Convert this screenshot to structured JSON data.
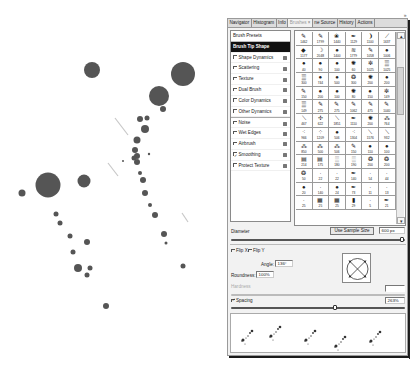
{
  "artwork": {
    "description": "ink splatter",
    "ink_color": "#555555"
  },
  "panel": {
    "tabs": [
      {
        "label": "Navigator",
        "active": false
      },
      {
        "label": "Histogram",
        "active": false
      },
      {
        "label": "Info",
        "active": false
      },
      {
        "label": "Brushes",
        "active": true,
        "close": "×"
      },
      {
        "label": "ne Source",
        "active": false
      },
      {
        "label": "History",
        "active": false
      },
      {
        "label": "Actions",
        "active": false
      }
    ],
    "menu_icon": "»",
    "settings": [
      {
        "label": "Brush Presets",
        "type": "header"
      },
      {
        "label": "Brush Tip Shape",
        "type": "selected"
      },
      {
        "label": "Shape Dynamics",
        "checked": false,
        "lock": true
      },
      {
        "label": "Scattering",
        "checked": false,
        "lock": true
      },
      {
        "label": "Texture",
        "checked": false,
        "lock": true
      },
      {
        "label": "Dual Brush",
        "checked": false,
        "lock": true
      },
      {
        "label": "Color Dynamics",
        "checked": false,
        "lock": true
      },
      {
        "label": "Other Dynamics",
        "checked": false,
        "lock": true
      },
      {
        "label": "Noise",
        "checked": false,
        "lock": true
      },
      {
        "label": "Wet Edges",
        "checked": false,
        "lock": true
      },
      {
        "label": "Airbrush",
        "checked": false,
        "lock": true
      },
      {
        "label": "Smoothing",
        "checked": true,
        "lock": true
      },
      {
        "label": "Protect Texture",
        "checked": false,
        "lock": true
      }
    ],
    "brushes": [
      {
        "n": "1462",
        "g": "✎"
      },
      {
        "n": "1799",
        "g": "✎"
      },
      {
        "n": "1440",
        "g": "❀"
      },
      {
        "n": "1129",
        "g": "✒"
      },
      {
        "n": "1100",
        "g": "❩"
      },
      {
        "n": "1637",
        "g": "⟋"
      },
      {
        "n": "1177",
        "g": "◆"
      },
      {
        "n": "2048",
        "g": "☽"
      },
      {
        "n": "1400",
        "g": "●"
      },
      {
        "n": "1779",
        "g": "≋"
      },
      {
        "n": "1058",
        "g": "✎"
      },
      {
        "n": "1006",
        "g": "●"
      },
      {
        "n": "40",
        "g": "●"
      },
      {
        "n": "90",
        "g": "●"
      },
      {
        "n": "100",
        "g": "●"
      },
      {
        "n": "60",
        "g": "✺"
      },
      {
        "n": "1025",
        "g": "✼"
      },
      {
        "n": "1025",
        "g": "▒"
      },
      {
        "n": "300",
        "g": "▒"
      },
      {
        "n": "744",
        "g": "●"
      },
      {
        "n": "500",
        "g": "●"
      },
      {
        "n": "300",
        "g": "❂"
      },
      {
        "n": "200",
        "g": "✺"
      },
      {
        "n": "200",
        "g": "●"
      },
      {
        "n": "150",
        "g": "✎"
      },
      {
        "n": "200",
        "g": "●"
      },
      {
        "n": "100",
        "g": "●"
      },
      {
        "n": "80",
        "g": "✺"
      },
      {
        "n": "150",
        "g": "●"
      },
      {
        "n": "149",
        "g": "✼"
      },
      {
        "n": "149",
        "g": "▒"
      },
      {
        "n": "275",
        "g": "✎"
      },
      {
        "n": "275",
        "g": "✎"
      },
      {
        "n": "1062",
        "g": "✎"
      },
      {
        "n": "475",
        "g": "✎"
      },
      {
        "n": "1040",
        "g": "✎"
      },
      {
        "n": "467",
        "g": "⟍"
      },
      {
        "n": "622",
        "g": "✢"
      },
      {
        "n": "1851",
        "g": "⟍"
      },
      {
        "n": "1110",
        "g": "✒"
      },
      {
        "n": "200",
        "g": "✺"
      },
      {
        "n": "764",
        "g": "⁂"
      },
      {
        "n": "966",
        "g": "⁖"
      },
      {
        "n": "1209",
        "g": "⁘"
      },
      {
        "n": "506",
        "g": "●"
      },
      {
        "n": "1304",
        "g": "⁖"
      },
      {
        "n": "1576",
        "g": "⟍"
      },
      {
        "n": "932",
        "g": "⟍"
      },
      {
        "n": "850",
        "g": "⁂"
      },
      {
        "n": "500",
        "g": "⁂"
      },
      {
        "n": "506",
        "g": "⁂"
      },
      {
        "n": "150",
        "g": "✎"
      },
      {
        "n": "110",
        "g": "●"
      },
      {
        "n": "100",
        "g": "●"
      },
      {
        "n": "214",
        "g": "▤"
      },
      {
        "n": "175",
        "g": "▤"
      },
      {
        "n": "180",
        "g": "░"
      },
      {
        "n": "190",
        "g": "░"
      },
      {
        "n": "200",
        "g": "❂"
      },
      {
        "n": "200",
        "g": "❂"
      },
      {
        "n": "50",
        "g": "❂"
      },
      {
        "n": "22",
        "g": "·"
      },
      {
        "n": "22",
        "g": "·"
      },
      {
        "n": "140",
        "g": "✒"
      },
      {
        "n": "54",
        "g": "·"
      },
      {
        "n": "44",
        "g": "·"
      },
      {
        "n": "20",
        "g": "●"
      },
      {
        "n": "140",
        "g": "·"
      },
      {
        "n": "24",
        "g": "●"
      },
      {
        "n": "73",
        "g": "✒"
      },
      {
        "n": "11",
        "g": "·"
      },
      {
        "n": "13",
        "g": "·"
      },
      {
        "n": "25",
        "g": "·"
      },
      {
        "n": "25",
        "g": "▦"
      },
      {
        "n": "25",
        "g": "▦"
      },
      {
        "n": "29",
        "g": "▮"
      },
      {
        "n": "5",
        "g": "·"
      },
      {
        "n": "21",
        "g": "✒"
      }
    ],
    "controls": {
      "diameter_label": "Diameter",
      "use_sample_size": "Use Sample Size",
      "diameter_value": "600 px",
      "diameter_slider": 0.98,
      "flip_x": "Flip X",
      "flip_y": "Flip Y",
      "flip_x_checked": false,
      "flip_y_checked": false,
      "angle_label": "Angle:",
      "angle_value": "136°",
      "roundness_label": "Roundness:",
      "roundness_value": "100%",
      "hardness_label": "Hardness",
      "hardness_value": "",
      "spacing_label": "Spacing",
      "spacing_checked": true,
      "spacing_value": "263%",
      "spacing_slider": 0.6
    }
  }
}
